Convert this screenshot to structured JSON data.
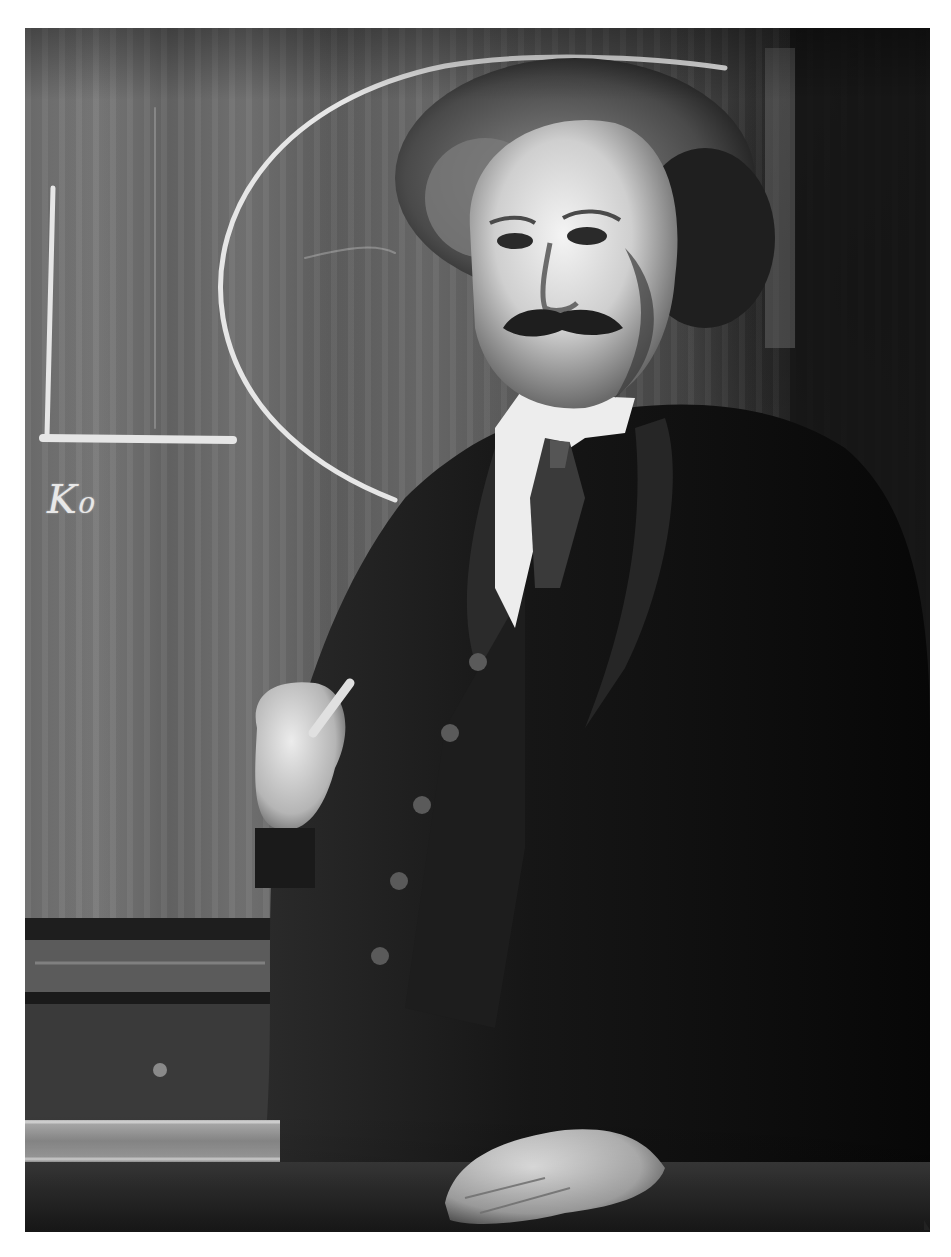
{
  "image": {
    "type": "black-and-white portrait photograph",
    "subject": "man in dark three-piece suit standing in front of a chalkboard, holding a piece of chalk",
    "chalkboard": {
      "writing": "K₀",
      "drawings": [
        "rectangle corner (L-shape) at left",
        "large semicircular arc"
      ]
    },
    "colors": {
      "page_background": "#ffffff",
      "chalkboard": "#6a6a6a",
      "chalk": "#e6e6e6",
      "suit": "#121212",
      "skin": "#d8d8d8",
      "collar": "#f2f2f2",
      "ledge": "#8f8f8f"
    }
  }
}
